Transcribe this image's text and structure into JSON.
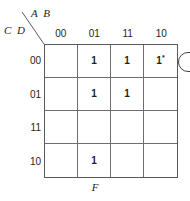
{
  "diagram": {
    "type": "karnaugh-map",
    "title_variables_top": "A B",
    "title_variables_left": "C D",
    "output_label": "F",
    "column_headers": [
      "00",
      "01",
      "11",
      "10"
    ],
    "row_headers": [
      "00",
      "01",
      "11",
      "10"
    ],
    "cells": [
      {
        "row": "00",
        "col": "00",
        "value": ""
      },
      {
        "row": "00",
        "col": "01",
        "value": "1"
      },
      {
        "row": "00",
        "col": "11",
        "value": "1"
      },
      {
        "row": "00",
        "col": "10",
        "value": "1",
        "superscript": "*"
      },
      {
        "row": "01",
        "col": "00",
        "value": ""
      },
      {
        "row": "01",
        "col": "01",
        "value": "1"
      },
      {
        "row": "01",
        "col": "11",
        "value": "1"
      },
      {
        "row": "01",
        "col": "10",
        "value": ""
      },
      {
        "row": "11",
        "col": "00",
        "value": ""
      },
      {
        "row": "11",
        "col": "01",
        "value": ""
      },
      {
        "row": "11",
        "col": "11",
        "value": ""
      },
      {
        "row": "11",
        "col": "10",
        "value": ""
      },
      {
        "row": "10",
        "col": "00",
        "value": ""
      },
      {
        "row": "10",
        "col": "01",
        "value": "1"
      },
      {
        "row": "10",
        "col": "11",
        "value": ""
      },
      {
        "row": "10",
        "col": "10",
        "value": ""
      }
    ],
    "groups": [
      {
        "name": "group-row00-cols-11-10",
        "row_index": 0,
        "col_start_index": 2,
        "col_end_index": 3,
        "covers": [
          "1",
          "1*"
        ]
      }
    ],
    "colors": {
      "ink": "#231f20",
      "grid_line": "#6d6e71",
      "group_outline": "#414042",
      "background": "#ffffff"
    }
  }
}
